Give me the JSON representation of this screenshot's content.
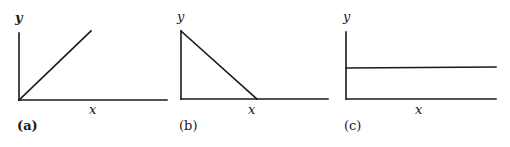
{
  "figure": {
    "panels": [
      {
        "id": "a",
        "label": "(a)",
        "x_label": "x",
        "y_label": "y",
        "relationship": "increasing linear (direct proportion)"
      },
      {
        "id": "b",
        "label": "(b)",
        "x_label": "x",
        "y_label": "y",
        "relationship": "decreasing linear"
      },
      {
        "id": "c",
        "label": "(c)",
        "x_label": "x",
        "y_label": "y",
        "relationship": "constant (horizontal line)"
      }
    ],
    "line_color": "#1a1a1a"
  }
}
